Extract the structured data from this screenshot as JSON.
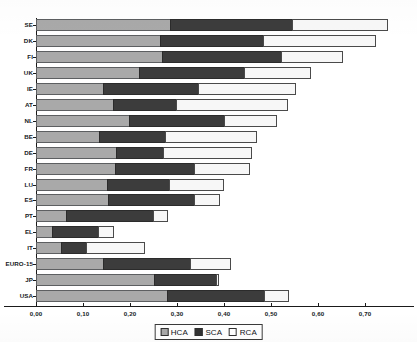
{
  "chart_data": {
    "type": "bar",
    "orientation": "horizontal",
    "stacked": true,
    "title": "",
    "xlabel": "",
    "ylabel": "",
    "xlim": [
      0.0,
      0.78
    ],
    "xticks": [
      0.0,
      0.1,
      0.2,
      0.3,
      0.4,
      0.5,
      0.6,
      0.7
    ],
    "xtick_labels": [
      "0,00",
      "0,10",
      "0,20",
      "0,30",
      "0,40",
      "0,50",
      "0,60",
      "0,70"
    ],
    "grid": false,
    "legend_position": "bottom",
    "legend": [
      "HCA",
      "SCA",
      "RCA"
    ],
    "colors": {
      "HCA": "#a9a9a9",
      "SCA": "#3c3c3c",
      "RCA": "#f7f7f7"
    },
    "categories": [
      "SE",
      "DK",
      "FI",
      "UK",
      "IE",
      "AT",
      "NL",
      "BE",
      "DE",
      "FR",
      "LU",
      "ES",
      "PT",
      "EL",
      "IT",
      "EURO-15",
      "JP",
      "USA"
    ],
    "series": [
      {
        "name": "HCA",
        "values": [
          0.287,
          0.266,
          0.27,
          0.221,
          0.145,
          0.166,
          0.2,
          0.136,
          0.172,
          0.17,
          0.153,
          0.155,
          0.066,
          0.036,
          0.055,
          0.145,
          0.253,
          0.281
        ]
      },
      {
        "name": "SCA",
        "values": [
          0.262,
          0.221,
          0.256,
          0.226,
          0.204,
          0.136,
          0.204,
          0.143,
          0.102,
          0.17,
          0.134,
          0.185,
          0.187,
          0.1,
          0.055,
          0.187,
          0.134,
          0.208
        ]
      },
      {
        "name": "RCA",
        "values": [
          0.204,
          0.24,
          0.132,
          0.143,
          0.209,
          0.238,
          0.113,
          0.196,
          0.19,
          0.119,
          0.117,
          0.055,
          0.032,
          0.034,
          0.126,
          0.087,
          0.006,
          0.053
        ]
      }
    ],
    "totals": [
      0.753,
      0.727,
      0.658,
      0.59,
      0.558,
      0.54,
      0.517,
      0.475,
      0.464,
      0.459,
      0.404,
      0.395,
      0.285,
      0.17,
      0.236,
      0.419,
      0.393,
      0.542
    ]
  },
  "axis": {
    "y_labels": [
      "SE",
      "DK",
      "FI",
      "UK",
      "IE",
      "AT",
      "NL",
      "BE",
      "DE",
      "FR",
      "LU",
      "ES",
      "PT",
      "EL",
      "IT",
      "EURO-15",
      "JP",
      "USA"
    ],
    "x_labels": [
      "0,00",
      "0,10",
      "0,20",
      "0,30",
      "0,40",
      "0,50",
      "0,60",
      "0,70"
    ]
  },
  "legend": {
    "items": [
      {
        "label": "HCA",
        "swatch": "legend-swatch-hca"
      },
      {
        "label": "SCA",
        "swatch": "legend-swatch-sca"
      },
      {
        "label": "RCA",
        "swatch": "legend-swatch-rca"
      }
    ]
  },
  "header": {
    "title": ""
  }
}
